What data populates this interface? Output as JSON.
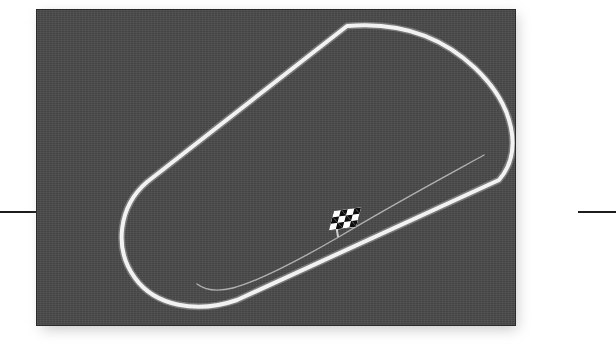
{
  "figure": {
    "kind": "race-circuit-map",
    "title": "Oval race circuit layout",
    "panel": {
      "background_color": "#4a4a4a",
      "border_color": "#2b2b2b",
      "x": 36,
      "y": 9,
      "width": 480,
      "height": 317,
      "has_texture": true,
      "has_drop_shadow": true,
      "shadow_color": "#9a9a9a"
    },
    "rules": {
      "color": "#1c1c1c",
      "thickness": 2,
      "y": 211,
      "left_label": "left rule",
      "right_label": "right rule"
    }
  },
  "track": {
    "name": "Main circuit",
    "shape": "oval superspeedway",
    "orientation": "diagonal, rotated approximately -34 degrees",
    "line_color": "#f2f2f2",
    "line_width": 4,
    "turns": 2,
    "straights": 2,
    "path": "M 310 16 C 355 12 400 22 438 58 C 478 96 486 142 462 170 L 200 290 C 160 304 118 296 98 268 C 76 238 82 196 110 172 Z",
    "glow_color": "#cfcfcf"
  },
  "pit_lane": {
    "name": "Pit lane",
    "line_color": "#c9c9c9",
    "line_width": 1.4,
    "opacity": 0.8,
    "entry_description": "branches from the main straight near turn exit",
    "exit_description": "rejoins the main straight before the left turn",
    "path": "M 447 145 C 420 160 360 192 300 228 C 255 254 218 272 196 278 C 180 282 168 280 160 274"
  },
  "start_finish": {
    "name": "Start/Finish line",
    "marker": "checkered-flag-icon",
    "x": 295,
    "y": 199,
    "checker_colors": [
      "#0d0d0d",
      "#ffffff"
    ],
    "pole_color": "#e9e9e9"
  }
}
